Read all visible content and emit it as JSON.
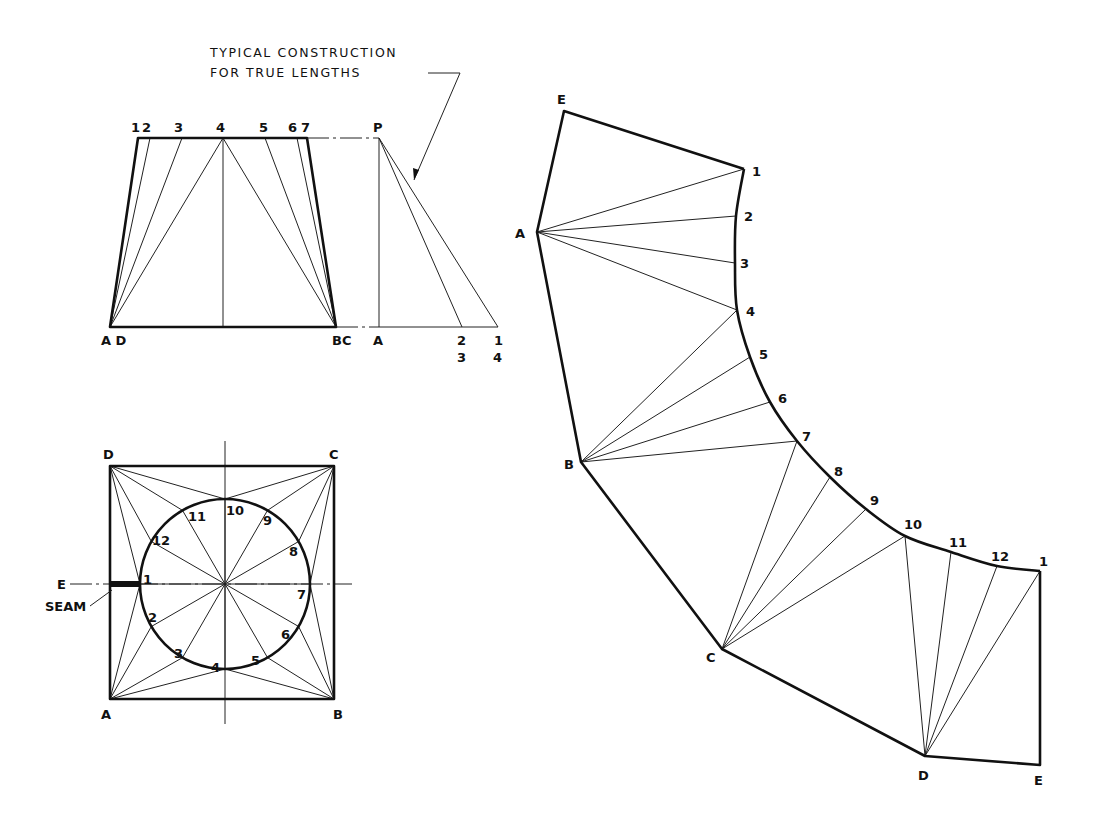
{
  "diagram": {
    "annotation": {
      "line1": "TYPICAL CONSTRUCTION",
      "line2": "FOR TRUE LENGTHS",
      "text_x": 210,
      "text_y1": 57,
      "text_y2": 77,
      "leader": [
        [
          428,
          73
        ],
        [
          460,
          73
        ],
        [
          414,
          180
        ]
      ]
    },
    "front_view": {
      "trapezoid": [
        [
          138,
          138
        ],
        [
          307,
          138
        ],
        [
          336,
          327
        ],
        [
          110,
          327
        ]
      ],
      "apex_top": [
        225,
        138
      ],
      "top_points": [
        {
          "label": "1",
          "x": 138
        },
        {
          "label": "2",
          "x": 150
        },
        {
          "label": "3",
          "x": 182
        },
        {
          "label": "4",
          "x": 223
        },
        {
          "label": "5",
          "x": 265
        },
        {
          "label": "6",
          "x": 297
        },
        {
          "label": "7",
          "x": 307
        }
      ],
      "top_labels": [
        {
          "text": "1",
          "x": 131,
          "y": 132
        },
        {
          "text": "2",
          "x": 142,
          "y": 132
        },
        {
          "text": "3",
          "x": 174,
          "y": 132
        },
        {
          "text": "4",
          "x": 216,
          "y": 132
        },
        {
          "text": "5",
          "x": 259,
          "y": 132
        },
        {
          "text": "6",
          "x": 288,
          "y": 132
        },
        {
          "text": "7",
          "x": 301,
          "y": 132
        }
      ],
      "bottom_left": [
        110,
        327
      ],
      "bottom_right": [
        336,
        327
      ],
      "bottom_labels": [
        {
          "text": "A D",
          "x": 101,
          "y": 345
        },
        {
          "text": "BC",
          "x": 332,
          "y": 345
        }
      ],
      "left_fan_targets": [
        "1",
        "2",
        "3",
        "4"
      ],
      "right_fan_targets": [
        "4",
        "5",
        "6",
        "7"
      ],
      "center_line": [
        [
          223,
          138
        ],
        [
          223,
          327
        ]
      ]
    },
    "true_length": {
      "P": [
        379,
        138
      ],
      "A": [
        379,
        327
      ],
      "ends": [
        [
          462,
          327
        ],
        [
          498,
          327
        ]
      ],
      "labels": [
        {
          "text": "P",
          "x": 373,
          "y": 132
        },
        {
          "text": "A",
          "x": 373,
          "y": 345
        },
        {
          "text": "2",
          "x": 457,
          "y": 345
        },
        {
          "text": "3",
          "x": 457,
          "y": 362
        },
        {
          "text": "1",
          "x": 494,
          "y": 345
        },
        {
          "text": "4",
          "x": 493,
          "y": 362
        }
      ],
      "dash_top": [
        [
          307,
          138
        ],
        [
          379,
          138
        ]
      ],
      "dash_bottom": [
        [
          336,
          327
        ],
        [
          379,
          327
        ]
      ]
    },
    "plan_view": {
      "square": {
        "x": 110,
        "y": 466,
        "w": 224,
        "h": 233
      },
      "center": [
        225,
        584
      ],
      "radius": 85,
      "corners": [
        {
          "text": "D",
          "x": 103,
          "y": 459
        },
        {
          "text": "C",
          "x": 329,
          "y": 459
        },
        {
          "text": "A",
          "x": 101,
          "y": 719
        },
        {
          "text": "B",
          "x": 333,
          "y": 719
        }
      ],
      "circle_points": [
        {
          "label": "1",
          "angle": 180,
          "lx": 143,
          "ly": 584
        },
        {
          "label": "2",
          "angle": 210,
          "lx": 148,
          "ly": 622
        },
        {
          "label": "3",
          "angle": 240,
          "lx": 174,
          "ly": 658
        },
        {
          "label": "4",
          "angle": 270,
          "lx": 211,
          "ly": 672
        },
        {
          "label": "5",
          "angle": 300,
          "lx": 251,
          "ly": 665
        },
        {
          "label": "6",
          "angle": 330,
          "lx": 281,
          "ly": 639
        },
        {
          "label": "7",
          "angle": 0,
          "lx": 297,
          "ly": 599
        },
        {
          "label": "8",
          "angle": 30,
          "lx": 289,
          "ly": 556
        },
        {
          "label": "9",
          "angle": 60,
          "lx": 263,
          "ly": 525
        },
        {
          "label": "10",
          "angle": 90,
          "lx": 226,
          "ly": 515
        },
        {
          "label": "11",
          "angle": 120,
          "lx": 188,
          "ly": 521
        },
        {
          "label": "12",
          "angle": 150,
          "lx": 152,
          "ly": 545
        }
      ],
      "corner_fans": {
        "A": [
          "1",
          "2",
          "3",
          "4"
        ],
        "B": [
          "4",
          "5",
          "6",
          "7"
        ],
        "C": [
          "7",
          "8",
          "9",
          "10"
        ],
        "D": [
          "10",
          "11",
          "12",
          "1"
        ]
      },
      "seam": {
        "E_label": "E",
        "seam_label": "SEAM",
        "E_x": 57,
        "E_y": 589,
        "seam_x": 45,
        "seam_y": 611
      }
    },
    "development": {
      "outline": [
        {
          "p": "E",
          "xy": [
            564,
            111
          ]
        },
        {
          "p": "1",
          "xy": [
            744,
            169
          ]
        },
        {
          "p": "A",
          "xy": [
            537,
            232
          ]
        },
        {
          "p": "B",
          "xy": [
            581,
            462
          ]
        },
        {
          "p": "C",
          "xy": [
            722,
            649
          ]
        },
        {
          "p": "D",
          "xy": [
            925,
            756
          ]
        },
        {
          "p": "E2",
          "xy": [
            1040,
            765
          ]
        },
        {
          "p": "1b",
          "xy": [
            1040,
            571
          ]
        }
      ],
      "curve": [
        {
          "label": "1",
          "xy": [
            744,
            169
          ],
          "lx": 748,
          "ly": 176
        },
        {
          "label": "2",
          "xy": [
            736,
            216
          ],
          "lx": 740,
          "ly": 221
        },
        {
          "label": "3",
          "xy": [
            735,
            263
          ],
          "lx": 736,
          "ly": 268
        },
        {
          "label": "4",
          "xy": [
            737,
            310
          ],
          "lx": 742,
          "ly": 316
        },
        {
          "label": "5",
          "xy": [
            750,
            357
          ],
          "lx": 755,
          "ly": 359
        },
        {
          "label": "6",
          "xy": [
            770,
            402
          ],
          "lx": 774,
          "ly": 403
        },
        {
          "label": "7",
          "xy": [
            797,
            441
          ],
          "lx": 798,
          "ly": 441
        },
        {
          "label": "8",
          "xy": [
            830,
            477
          ],
          "lx": 830,
          "ly": 476
        },
        {
          "label": "9",
          "xy": [
            866,
            509
          ],
          "lx": 866,
          "ly": 505
        },
        {
          "label": "10",
          "xy": [
            905,
            536
          ],
          "lx": 900,
          "ly": 529
        },
        {
          "label": "11",
          "xy": [
            951,
            552
          ],
          "lx": 945,
          "ly": 547
        },
        {
          "label": "12",
          "xy": [
            997,
            566
          ],
          "lx": 987,
          "ly": 561
        },
        {
          "label": "1",
          "xy": [
            1040,
            571
          ],
          "lx": 1035,
          "ly": 566
        }
      ],
      "vertex_labels": [
        {
          "text": "E",
          "x": 557,
          "y": 104
        },
        {
          "text": "A",
          "x": 515,
          "y": 238
        },
        {
          "text": "B",
          "x": 564,
          "y": 469
        },
        {
          "text": "C",
          "x": 706,
          "y": 662
        },
        {
          "text": "D",
          "x": 918,
          "y": 780
        },
        {
          "text": "E",
          "x": 1034,
          "y": 785
        }
      ],
      "fans": {
        "A": [
          "1",
          "2",
          "3",
          "4"
        ],
        "B": [
          "4",
          "5",
          "6",
          "7"
        ],
        "C": [
          "7",
          "8",
          "9",
          "10"
        ],
        "D": [
          "10",
          "11",
          "12",
          "1"
        ]
      }
    }
  }
}
